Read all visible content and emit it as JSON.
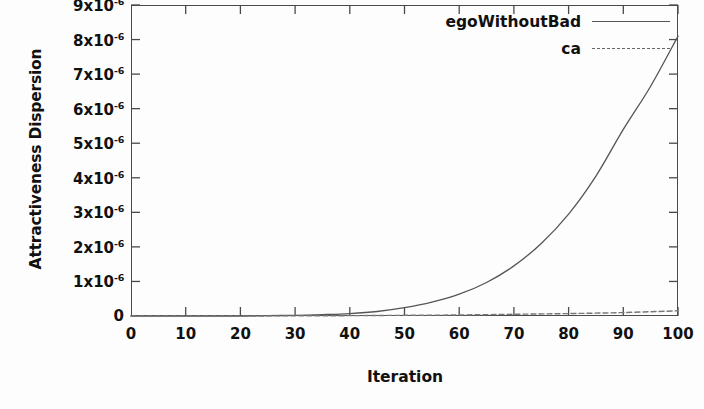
{
  "chart_data": {
    "type": "line",
    "title": "",
    "xlabel": "Iteration",
    "ylabel": "Attractiveness Dispersion",
    "xlim": [
      0,
      100
    ],
    "ylim": [
      0,
      9e-06
    ],
    "grid": false,
    "legend_position": "top-right-inside",
    "x_tick_labels": [
      "0",
      "10",
      "20",
      "30",
      "40",
      "50",
      "60",
      "70",
      "80",
      "90",
      "100"
    ],
    "x_ticks": [
      0,
      10,
      20,
      30,
      40,
      50,
      60,
      70,
      80,
      90,
      100
    ],
    "y_ticks": [
      0,
      1e-06,
      2e-06,
      3e-06,
      4e-06,
      5e-06,
      6e-06,
      7e-06,
      8e-06,
      9e-06
    ],
    "y_tick_labels": [
      "0",
      "1x10-6",
      "2x10-6",
      "3x10-6",
      "4x10-6",
      "5x10-6",
      "6x10-6",
      "7x10-6",
      "8x10-6",
      "9x10-6"
    ],
    "y_tick_mantissas": [
      "0",
      "1x10",
      "2x10",
      "3x10",
      "4x10",
      "5x10",
      "6x10",
      "7x10",
      "8x10",
      "9x10"
    ],
    "y_tick_exponent": "-6",
    "series": [
      {
        "name": "egoWithoutBad",
        "style": "solid",
        "color": "#555555",
        "x": [
          0,
          5,
          10,
          15,
          20,
          25,
          30,
          35,
          40,
          45,
          50,
          55,
          60,
          65,
          70,
          75,
          80,
          85,
          90,
          95,
          100
        ],
        "values": [
          0.0,
          0.0,
          0.0,
          0.0,
          0.0,
          1e-08,
          2e-08,
          4e-08,
          7e-08,
          1.3e-07,
          2.4e-07,
          4e-07,
          6.3e-07,
          9.7e-07,
          1.45e-06,
          2.1e-06,
          2.95e-06,
          4.05e-06,
          5.4e-06,
          6.65e-06,
          8.1e-06
        ]
      },
      {
        "name": "ca",
        "style": "dashed",
        "color": "#777777",
        "x": [
          0,
          10,
          20,
          30,
          40,
          50,
          60,
          70,
          80,
          90,
          100
        ],
        "values": [
          0.0,
          0.0,
          0.0,
          5e-09,
          1e-08,
          2e-08,
          3e-08,
          5e-08,
          7e-08,
          1e-07,
          1.5e-07
        ]
      }
    ]
  },
  "colors": {
    "background": "#fdfdfd",
    "axis": "#4a4a4a",
    "text": "#111111",
    "series_ego": "#555555",
    "series_ca": "#777777"
  }
}
